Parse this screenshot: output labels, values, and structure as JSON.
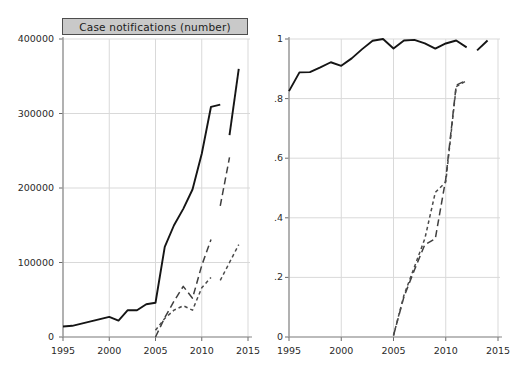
{
  "figure": {
    "background": "#ffffff",
    "panel_title_bg": "#c9c9c9",
    "panel_title_border": "#4d4d4d",
    "gridline_color": "#d9d9d9",
    "axis_color": "#8a8a8a"
  },
  "panels": {
    "left": {
      "title": "Case notifications (number)",
      "y_ticks": [
        "0",
        "100000",
        "200000",
        "300000",
        "400000"
      ],
      "x_ticks": [
        "1995",
        "2000",
        "2005",
        "2010",
        "2015"
      ]
    },
    "right": {
      "title": "Age disaggregation available (proportion)",
      "y_ticks": [
        "0",
        ".2",
        ".4",
        ".6",
        ".8",
        "1"
      ],
      "x_ticks": [
        "1995",
        "2000",
        "2005",
        "2010",
        "2015"
      ]
    }
  },
  "footnote": "",
  "chart_data": [
    {
      "type": "line",
      "title": "Case notifications (number)",
      "xlabel": "",
      "ylabel": "",
      "xlim": [
        1995,
        2015
      ],
      "ylim": [
        0,
        400000
      ],
      "xticks": [
        1995,
        2000,
        2005,
        2010,
        2015
      ],
      "yticks": [
        0,
        100000,
        200000,
        300000,
        400000
      ],
      "grid": true,
      "legend": "none",
      "series": [
        {
          "name": "solid-series",
          "style": "solid",
          "color": "#151515",
          "segments": [
            {
              "x": [
                1995,
                1996,
                1997,
                1998,
                1999,
                2000,
                2001,
                2002,
                2003,
                2004,
                2005,
                2006,
                2007,
                2008,
                2009,
                2010,
                2011,
                2012
              ],
              "y": [
                14000,
                15000,
                18000,
                21000,
                24000,
                27000,
                22000,
                36000,
                36000,
                44000,
                46000,
                121000,
                150000,
                172000,
                198000,
                246000,
                309000,
                312000
              ]
            },
            {
              "x": [
                2013,
                2014
              ],
              "y": [
                271000,
                360000
              ]
            }
          ]
        },
        {
          "name": "long-dash-series",
          "style": "long-dash",
          "color": "#3f3f3f",
          "segments": [
            {
              "x": [
                2005,
                2006,
                2007,
                2008,
                2009,
                2010,
                2011
              ],
              "y": [
                0,
                26000,
                48000,
                68000,
                52000,
                96000,
                131000
              ]
            },
            {
              "x": [
                2012,
                2013
              ],
              "y": [
                176000,
                241000
              ]
            }
          ]
        },
        {
          "name": "short-dash-series",
          "style": "short-dash",
          "color": "#4a4a4a",
          "segments": [
            {
              "x": [
                2005,
                2006,
                2007,
                2008,
                2009,
                2010,
                2011
              ],
              "y": [
                9000,
                25000,
                36000,
                42000,
                36000,
                66000,
                80000
              ]
            },
            {
              "x": [
                2012,
                2013,
                2014
              ],
              "y": [
                76000,
                100000,
                124000
              ]
            }
          ]
        }
      ]
    },
    {
      "type": "line",
      "title": "Age disaggregation available (proportion)",
      "xlabel": "",
      "ylabel": "",
      "xlim": [
        1995,
        2015
      ],
      "ylim": [
        0,
        1
      ],
      "xticks": [
        1995,
        2000,
        2005,
        2010,
        2015
      ],
      "yticks": [
        0,
        0.2,
        0.4,
        0.6,
        0.8,
        1
      ],
      "grid": true,
      "legend": "none",
      "series": [
        {
          "name": "solid-series",
          "style": "solid",
          "color": "#151515",
          "segments": [
            {
              "x": [
                1995,
                1996,
                1997,
                1998,
                1999,
                2000,
                2001,
                2002,
                2003,
                2004,
                2005,
                2006,
                2007,
                2008,
                2009,
                2010,
                2011,
                2012
              ],
              "y": [
                0.825,
                0.888,
                0.889,
                0.905,
                0.922,
                0.91,
                0.935,
                0.966,
                0.994,
                1.0,
                0.968,
                0.995,
                0.997,
                0.985,
                0.968,
                0.985,
                0.995,
                0.972
              ]
            },
            {
              "x": [
                2013,
                2014
              ],
              "y": [
                0.962,
                0.995
              ]
            }
          ]
        },
        {
          "name": "long-dash-series",
          "style": "long-dash",
          "color": "#3f3f3f",
          "segments": [
            {
              "x": [
                2005,
                2006,
                2007,
                2008,
                2009,
                2010,
                2011,
                2012
              ],
              "y": [
                0.005,
                0.135,
                0.225,
                0.31,
                0.33,
                0.53,
                0.845,
                0.862
              ]
            }
          ]
        },
        {
          "name": "short-dash-series",
          "style": "short-dash",
          "color": "#4a4a4a",
          "segments": [
            {
              "x": [
                2005,
                2006,
                2007,
                2008,
                2009,
                2010,
                2011,
                2012
              ],
              "y": [
                0.005,
                0.14,
                0.235,
                0.33,
                0.485,
                0.52,
                0.84,
                0.86
              ]
            }
          ]
        }
      ]
    }
  ]
}
